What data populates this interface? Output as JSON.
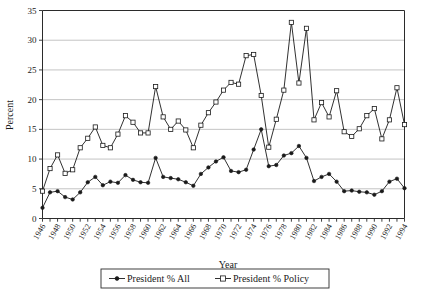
{
  "chart_data": {
    "type": "line",
    "title": "",
    "xlabel": "Year",
    "ylabel": "Percent",
    "xlim": [
      1946,
      1994
    ],
    "ylim": [
      0,
      35
    ],
    "yticks": [
      0,
      5,
      10,
      15,
      20,
      25,
      30,
      35
    ],
    "xticks": [
      1946,
      1948,
      1950,
      1952,
      1954,
      1956,
      1958,
      1960,
      1962,
      1964,
      1966,
      1968,
      1970,
      1972,
      1974,
      1976,
      1978,
      1980,
      1982,
      1984,
      1986,
      1988,
      1990,
      1992,
      1994
    ],
    "grid": "horizontal",
    "legend_position": "bottom",
    "x": [
      1946,
      1947,
      1948,
      1949,
      1950,
      1951,
      1952,
      1953,
      1954,
      1955,
      1956,
      1957,
      1958,
      1959,
      1960,
      1961,
      1962,
      1963,
      1964,
      1965,
      1966,
      1967,
      1968,
      1969,
      1970,
      1971,
      1972,
      1973,
      1974,
      1975,
      1976,
      1977,
      1978,
      1979,
      1980,
      1981,
      1982,
      1983,
      1984,
      1985,
      1986,
      1987,
      1988,
      1989,
      1990,
      1991,
      1992,
      1993,
      1994
    ],
    "series": [
      {
        "name": "President % All",
        "marker": "filled-circle",
        "values": [
          1.8,
          4.4,
          4.6,
          3.6,
          3.2,
          4.4,
          6.1,
          7.0,
          5.6,
          6.2,
          6.0,
          7.3,
          6.5,
          6.1,
          6.0,
          10.2,
          7.0,
          6.8,
          6.6,
          6.1,
          5.5,
          7.5,
          8.6,
          9.6,
          10.3,
          8.0,
          7.8,
          8.2,
          11.6,
          15.0,
          8.8,
          9.0,
          10.6,
          11.0,
          12.2,
          10.2,
          6.3,
          7.0,
          7.5,
          6.2,
          4.6,
          4.7,
          4.5,
          4.4,
          4.0,
          4.6,
          6.2,
          6.7,
          5.1
        ]
      },
      {
        "name": "President % Policy",
        "marker": "open-square",
        "values": [
          4.6,
          8.4,
          10.7,
          7.6,
          8.2,
          11.9,
          13.5,
          15.4,
          12.3,
          11.9,
          14.2,
          17.3,
          16.2,
          14.4,
          14.4,
          22.2,
          17.1,
          15.0,
          16.4,
          14.9,
          11.9,
          15.7,
          17.8,
          19.6,
          21.6,
          22.9,
          22.6,
          27.4,
          27.6,
          20.7,
          12.0,
          16.7,
          21.6,
          33.0,
          22.8,
          32.0,
          16.6,
          19.5,
          17.1,
          21.5,
          14.6,
          13.8,
          15.1,
          17.3,
          18.5,
          13.4,
          16.6,
          22.0,
          15.8
        ]
      }
    ]
  },
  "legend": {
    "items": [
      {
        "label": "President % All",
        "marker": "filled-circle"
      },
      {
        "label": "President % Policy",
        "marker": "open-square"
      }
    ]
  }
}
